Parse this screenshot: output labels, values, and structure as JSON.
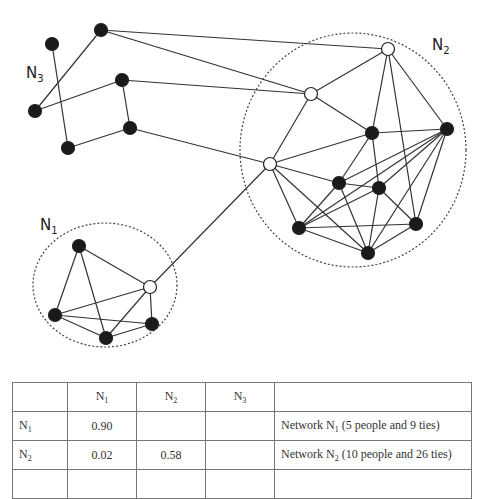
{
  "diagram": {
    "labels": [
      {
        "id": "N3",
        "base": "N",
        "sub": "3",
        "x": 26,
        "y": 78
      },
      {
        "id": "N2",
        "base": "N",
        "sub": "2",
        "x": 432,
        "y": 50
      },
      {
        "id": "N1",
        "base": "N",
        "sub": "1",
        "x": 40,
        "y": 230
      }
    ],
    "clusters": [
      {
        "id": "N2",
        "cx": 353,
        "cy": 150,
        "rx": 113,
        "ry": 117
      },
      {
        "id": "N1",
        "cx": 105,
        "cy": 285,
        "rx": 72,
        "ry": 62
      }
    ],
    "colors": {
      "node_fill": "#1a1a1a",
      "broker_fill": "#ffffff",
      "edge": "#333333"
    },
    "nodes": [
      {
        "id": "a1",
        "x": 52,
        "y": 44,
        "type": "black",
        "group": "N3"
      },
      {
        "id": "a2",
        "x": 101,
        "y": 30,
        "type": "black",
        "group": "N3"
      },
      {
        "id": "a3",
        "x": 35,
        "y": 111,
        "type": "black",
        "group": "N3"
      },
      {
        "id": "a4",
        "x": 122,
        "y": 80,
        "type": "black",
        "group": "N3"
      },
      {
        "id": "a5",
        "x": 130,
        "y": 128,
        "type": "black",
        "group": "N3"
      },
      {
        "id": "a6",
        "x": 68,
        "y": 148,
        "type": "black",
        "group": "N3"
      },
      {
        "id": "T",
        "x": 388,
        "y": 49,
        "type": "white",
        "group": "N2"
      },
      {
        "id": "M",
        "x": 311,
        "y": 94,
        "type": "white",
        "group": "N2"
      },
      {
        "id": "L",
        "x": 270,
        "y": 164,
        "type": "white",
        "group": "N2"
      },
      {
        "id": "A",
        "x": 372,
        "y": 133,
        "type": "black",
        "group": "N2"
      },
      {
        "id": "R",
        "x": 447,
        "y": 129,
        "type": "black",
        "group": "N2"
      },
      {
        "id": "B",
        "x": 339,
        "y": 183,
        "type": "black",
        "group": "N2"
      },
      {
        "id": "C",
        "x": 379,
        "y": 188,
        "type": "black",
        "group": "N2"
      },
      {
        "id": "D",
        "x": 299,
        "y": 228,
        "type": "black",
        "group": "N2"
      },
      {
        "id": "E",
        "x": 416,
        "y": 224,
        "type": "black",
        "group": "N2"
      },
      {
        "id": "F",
        "x": 368,
        "y": 253,
        "type": "black",
        "group": "N2"
      },
      {
        "id": "p1",
        "x": 79,
        "y": 246,
        "type": "black",
        "group": "N1"
      },
      {
        "id": "W",
        "x": 150,
        "y": 287,
        "type": "white",
        "group": "N1"
      },
      {
        "id": "p2",
        "x": 55,
        "y": 315,
        "type": "black",
        "group": "N1"
      },
      {
        "id": "p3",
        "x": 152,
        "y": 324,
        "type": "black",
        "group": "N1"
      },
      {
        "id": "p4",
        "x": 106,
        "y": 338,
        "type": "black",
        "group": "N1"
      }
    ],
    "edges": [
      [
        "a1",
        "a6"
      ],
      [
        "a2",
        "a3"
      ],
      [
        "a3",
        "a4"
      ],
      [
        "a4",
        "a5"
      ],
      [
        "a5",
        "a6"
      ],
      [
        "a2",
        "T"
      ],
      [
        "a2",
        "M"
      ],
      [
        "a4",
        "M"
      ],
      [
        "a5",
        "L"
      ],
      [
        "W",
        "L"
      ],
      [
        "T",
        "M"
      ],
      [
        "T",
        "A"
      ],
      [
        "T",
        "E"
      ],
      [
        "T",
        "R"
      ],
      [
        "M",
        "L"
      ],
      [
        "M",
        "A"
      ],
      [
        "L",
        "A"
      ],
      [
        "L",
        "B"
      ],
      [
        "L",
        "D"
      ],
      [
        "L",
        "F"
      ],
      [
        "A",
        "R"
      ],
      [
        "A",
        "B"
      ],
      [
        "A",
        "C"
      ],
      [
        "R",
        "B"
      ],
      [
        "R",
        "C"
      ],
      [
        "R",
        "D"
      ],
      [
        "R",
        "E"
      ],
      [
        "R",
        "F"
      ],
      [
        "B",
        "C"
      ],
      [
        "B",
        "D"
      ],
      [
        "B",
        "F"
      ],
      [
        "C",
        "D"
      ],
      [
        "C",
        "E"
      ],
      [
        "C",
        "F"
      ],
      [
        "D",
        "E"
      ],
      [
        "D",
        "F"
      ],
      [
        "E",
        "F"
      ],
      [
        "p1",
        "W"
      ],
      [
        "p1",
        "p2"
      ],
      [
        "p1",
        "p4"
      ],
      [
        "W",
        "p2"
      ],
      [
        "W",
        "p4"
      ],
      [
        "W",
        "p3"
      ],
      [
        "p2",
        "p3"
      ],
      [
        "p2",
        "p4"
      ],
      [
        "p4",
        "p3"
      ]
    ]
  },
  "table": {
    "header": [
      "",
      {
        "base": "N",
        "sub": "1"
      },
      {
        "base": "N",
        "sub": "2"
      },
      {
        "base": "N",
        "sub": "3"
      },
      ""
    ],
    "rows": [
      {
        "label": {
          "base": "N",
          "sub": "1"
        },
        "cells": [
          "0.90",
          "",
          ""
        ],
        "desc": {
          "pre": "Network N",
          "sub": "1",
          "post": " (5 people and 9 ties)"
        }
      },
      {
        "label": {
          "base": "N",
          "sub": "2"
        },
        "cells": [
          "0.02",
          "0.58",
          ""
        ],
        "desc": {
          "pre": "Network N",
          "sub": "2",
          "post": " (10 people and 26 ties)"
        }
      }
    ]
  }
}
